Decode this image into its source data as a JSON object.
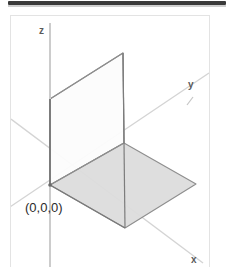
{
  "figure": {
    "background_color": "#ffffff",
    "frame_border_color": "#e3e3e3",
    "top_strip_color": "#3a3a3a"
  },
  "labels": {
    "z_axis": "z",
    "y_axis": "y",
    "x_axis": "x",
    "origin": "(0,0,0)"
  },
  "colors": {
    "axis_light": "#d0d0d0",
    "axis_dark": "#8a8a8a",
    "plane_edge": "#8e8e8e",
    "vertical_plane_fill": "#fbfbfb",
    "horizontal_plane_fill": "#dcdcdc",
    "label_text": "#5a5a5a",
    "origin_text": "#2b2b2b"
  },
  "geometry": {
    "origin": {
      "x": 49,
      "y": 184
    },
    "intersection": {
      "x": 123,
      "y": 142
    },
    "z_axis": {
      "x1": 49,
      "y1": 22,
      "x2": 49,
      "y2": 266
    },
    "y_axis": {
      "x1": 0,
      "y1": 212,
      "x2": 208,
      "y2": 72
    },
    "x_axis": {
      "x1": 10,
      "y1": 118,
      "x2": 202,
      "y2": 262
    },
    "y_axis_tick": {
      "x1": 186,
      "y1": 103,
      "x2": 192,
      "y2": 96
    },
    "vertical_plane_points": "49,98 122,52 123,142 49,184",
    "horizontal_plane_points": "49,184 123,142 195,183 124,227"
  }
}
